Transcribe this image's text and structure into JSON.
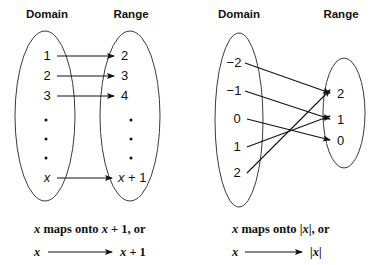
{
  "figure": {
    "background": "#ffffff",
    "ink": "#111111",
    "oval_stroke": "#3b3b3b"
  },
  "diagrams": [
    {
      "id": "left-mapping-diagram",
      "headers": {
        "domain": "Domain",
        "range": "Range"
      },
      "domain_items": [
        "1",
        "2",
        "3",
        "•",
        "•",
        "•",
        "x"
      ],
      "range_items": [
        "2",
        "3",
        "4",
        "•",
        "•",
        "•",
        "x + 1"
      ],
      "arrows": [
        {
          "from": "1",
          "to": "2"
        },
        {
          "from": "2",
          "to": "3"
        },
        {
          "from": "3",
          "to": "4"
        },
        {
          "from": "x",
          "to": "x + 1"
        }
      ],
      "caption_line1": "x maps onto x + 1, or",
      "caption_line2_from": "x",
      "caption_line2_to": "x + 1"
    },
    {
      "id": "right-mapping-diagram",
      "headers": {
        "domain": "Domain",
        "range": "Range"
      },
      "domain_items": [
        "−2",
        "−1",
        "0",
        "1",
        "2"
      ],
      "range_items": [
        "2",
        "1",
        "0"
      ],
      "arrows": [
        {
          "from": "−2",
          "to": "2"
        },
        {
          "from": "−1",
          "to": "1"
        },
        {
          "from": "0",
          "to": "0"
        },
        {
          "from": "1",
          "to": "1"
        },
        {
          "from": "2",
          "to": "2"
        }
      ],
      "caption_line1": "x maps onto |x|, or",
      "caption_line2_from": "x",
      "caption_line2_to": "|x|"
    }
  ],
  "labels": {
    "left_header_domain": "Domain",
    "left_header_range": "Range",
    "right_header_domain": "Domain",
    "right_header_range": "Range",
    "l_d_1": "1",
    "l_d_2": "2",
    "l_d_3": "3",
    "l_d_x": "x",
    "l_r_1": "2",
    "l_r_2": "3",
    "l_r_3": "4",
    "l_r_x": "x + 1",
    "r_d_1": "−2",
    "r_d_2": "−1",
    "r_d_3": "0",
    "r_d_4": "1",
    "r_d_5": "2",
    "r_r_1": "2",
    "r_r_2": "1",
    "r_r_3": "0",
    "left_caption_1a": "x",
    "left_caption_1b": " maps onto ",
    "left_caption_1c": "x",
    "left_caption_1d": " + 1, or",
    "left_caption_2a": "x",
    "left_caption_2b": "x",
    "left_caption_2c": " + 1",
    "right_caption_1a": "x",
    "right_caption_1b": " maps onto |",
    "right_caption_1c": "x",
    "right_caption_1d": "|, or",
    "right_caption_2a": "x",
    "right_caption_2b": "|x|"
  }
}
